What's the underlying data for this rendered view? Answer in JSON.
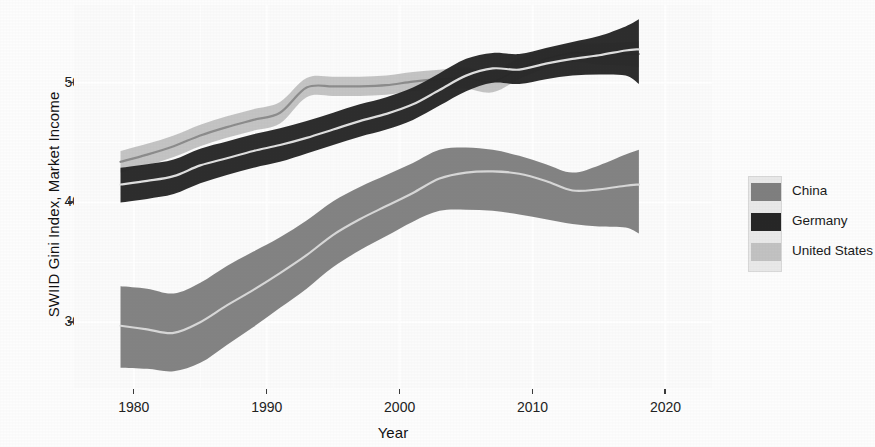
{
  "chart_data": {
    "type": "area",
    "title": "",
    "xlabel": "Year",
    "ylabel": "SWIID Gini Index, Market Income",
    "xlim": [
      1975.5,
      2023.5
    ],
    "ylim": [
      24.5,
      56.5
    ],
    "xticks": [
      1980,
      1990,
      2000,
      2010,
      2020
    ],
    "yticks": [
      30,
      40,
      50
    ],
    "grid": true,
    "grid_color": "#ffffff",
    "panel_background": "#fbfbfb",
    "legend_position": "right",
    "ribbon_note": "Each series is a shaded uncertainty ribbon (lower-upper) with a light center line for the point estimate",
    "series": [
      {
        "name": "China",
        "color": "#7f7f7f",
        "line_color": "#d8d8d8",
        "x": [
          1979,
          1981,
          1983,
          1985,
          1987,
          1989,
          1991,
          1993,
          1995,
          1997,
          1999,
          2001,
          2003,
          2005,
          2007,
          2009,
          2011,
          2013,
          2015,
          2017,
          2018
        ],
        "center": [
          29.7,
          29.4,
          29.1,
          30.0,
          31.4,
          32.7,
          34.1,
          35.6,
          37.3,
          38.6,
          39.7,
          40.8,
          42.0,
          42.5,
          42.6,
          42.4,
          41.8,
          41.0,
          41.1,
          41.4,
          41.5
        ],
        "lower": [
          26.2,
          26.1,
          25.9,
          26.6,
          28.1,
          29.6,
          31.2,
          32.8,
          34.6,
          36.0,
          37.2,
          38.4,
          39.3,
          39.4,
          39.3,
          39.0,
          38.6,
          38.2,
          38.0,
          37.9,
          37.4
        ],
        "upper": [
          33.0,
          32.8,
          32.4,
          33.3,
          34.7,
          35.9,
          37.1,
          38.5,
          40.1,
          41.3,
          42.3,
          43.3,
          44.4,
          44.6,
          44.4,
          43.9,
          43.2,
          42.5,
          43.1,
          44.0,
          44.4
        ]
      },
      {
        "name": "Germany",
        "color": "#262626",
        "line_color": "#e0e0e0",
        "x": [
          1979,
          1981,
          1983,
          1985,
          1987,
          1989,
          1991,
          1993,
          1995,
          1997,
          1999,
          2001,
          2003,
          2005,
          2007,
          2009,
          2011,
          2013,
          2015,
          2017,
          2018
        ],
        "center": [
          41.5,
          41.8,
          42.2,
          43.1,
          43.7,
          44.3,
          44.8,
          45.4,
          46.1,
          46.8,
          47.4,
          48.2,
          49.4,
          50.6,
          51.2,
          51.1,
          51.6,
          52.0,
          52.3,
          52.7,
          52.8
        ],
        "lower": [
          40.0,
          40.3,
          40.7,
          41.6,
          42.3,
          42.9,
          43.4,
          44.1,
          44.8,
          45.5,
          46.1,
          46.9,
          48.1,
          49.3,
          50.0,
          49.9,
          50.3,
          50.6,
          50.7,
          50.6,
          49.9
        ],
        "upper": [
          42.9,
          43.2,
          43.6,
          44.5,
          45.1,
          45.7,
          46.2,
          46.8,
          47.5,
          48.2,
          48.8,
          49.6,
          50.8,
          52.0,
          52.5,
          52.4,
          52.9,
          53.4,
          53.9,
          54.7,
          55.3
        ]
      },
      {
        "name": "United States",
        "color": "#c2c2c2",
        "line_color": "#8c8c8c",
        "x": [
          1979,
          1981,
          1983,
          1985,
          1987,
          1989,
          1991,
          1993,
          1995,
          1997,
          1999,
          2001,
          2003,
          2005,
          2007,
          2009,
          2011,
          2013,
          2015,
          2017,
          2018
        ],
        "center": [
          43.4,
          44.0,
          44.7,
          45.6,
          46.3,
          46.9,
          47.5,
          49.6,
          49.7,
          49.7,
          49.8,
          50.1,
          50.3,
          50.4,
          50.1,
          51.2,
          52.0,
          52.5,
          52.4,
          52.4,
          52.4
        ],
        "lower": [
          42.5,
          43.1,
          43.8,
          44.7,
          45.4,
          46.0,
          46.6,
          48.8,
          48.9,
          48.9,
          49.0,
          49.3,
          49.5,
          49.5,
          49.2,
          50.3,
          51.2,
          51.7,
          51.5,
          51.4,
          51.3
        ],
        "upper": [
          44.3,
          44.9,
          45.6,
          46.5,
          47.2,
          47.8,
          48.4,
          50.4,
          50.5,
          50.5,
          50.6,
          50.9,
          51.1,
          51.3,
          51.0,
          52.1,
          52.8,
          53.3,
          53.3,
          53.4,
          53.5
        ]
      }
    ]
  },
  "axes": {
    "y_title": "SWIID Gini Index, Market Income",
    "x_title": "Year",
    "y_ticks": [
      "30",
      "40",
      "50"
    ],
    "x_ticks": [
      "1980",
      "1990",
      "2000",
      "2010",
      "2020"
    ]
  },
  "legend": {
    "items": [
      {
        "label": "China",
        "color": "#7f7f7f"
      },
      {
        "label": "Germany",
        "color": "#262626"
      },
      {
        "label": "United States",
        "color": "#c2c2c2"
      }
    ]
  }
}
